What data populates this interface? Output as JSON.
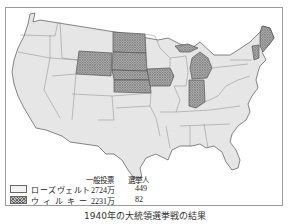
{
  "caption": "1940年の大統領選挙戦の結果",
  "legend": {
    "headers": {
      "popular_vote": "一般投票",
      "electoral": "選挙人"
    },
    "entries": [
      {
        "name": "ローズヴェルト",
        "pattern": "light-dotted",
        "popular_vote": "2724万",
        "electoral": "449"
      },
      {
        "name": "ウィルキー",
        "pattern": "dark-crosshatch",
        "popular_vote": "2231万",
        "electoral": "82"
      }
    ]
  },
  "map": {
    "title": "United States 1940 presidential election result map",
    "colors": {
      "roosevelt_fill": "#efefef",
      "willkie_fill": "#a8a8a8",
      "border": "#777777"
    },
    "willkie_states": [
      "North Dakota",
      "South Dakota",
      "Nebraska",
      "Kansas",
      "Colorado",
      "Iowa",
      "Michigan",
      "Indiana",
      "Maine",
      "Vermont"
    ]
  }
}
